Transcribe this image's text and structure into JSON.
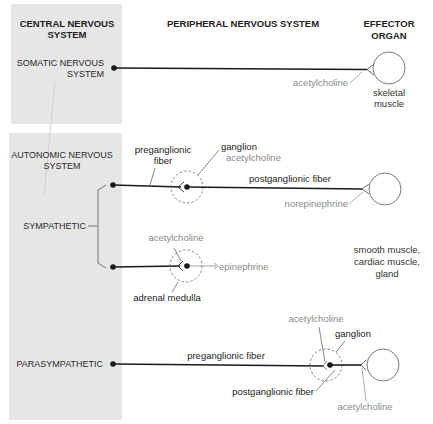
{
  "colors": {
    "panel": "#e6e6e6",
    "fiber": "#1a1a1a",
    "chemical_text": "#8a8a8a",
    "outline": "#6a6a6a"
  },
  "headers": {
    "cns_line1": "CENTRAL NERVOUS",
    "cns_line2": "SYSTEM",
    "pns": "PERIPHERAL NERVOUS SYSTEM",
    "effector_line1": "EFFECTOR",
    "effector_line2": "ORGAN"
  },
  "somatic": {
    "label_line1": "SOMATIC NERVOUS",
    "label_line2": "SYSTEM",
    "neurotransmitter": "acetylcholine",
    "effector_line1": "skeletal",
    "effector_line2": "muscle"
  },
  "autonomic": {
    "label_line1": "AUTONOMIC NERVOUS",
    "label_line2": "SYSTEM"
  },
  "sympathetic": {
    "label": "SYMPATHETIC",
    "preganglionic_line1": "preganglionic",
    "preganglionic_line2": "fiber",
    "ganglion": "ganglion",
    "ganglion_transmitter": "acetylcholine",
    "postganglionic": "postganglionic fiber",
    "effector_transmitter": "norepinephrine",
    "adrenal_transmitter": "acetylcholine",
    "adrenal_output": "epinephrine",
    "adrenal_label": "adrenal medulla",
    "effector_line1": "smooth muscle,",
    "effector_line2": "cardiac muscle,",
    "effector_line3": "gland"
  },
  "parasympathetic": {
    "label": "PARASYMPATHETIC",
    "preganglionic": "preganglionic fiber",
    "ganglion": "ganglion",
    "ganglion_transmitter": "acetylcholine",
    "postganglionic": "postganglionic fiber",
    "effector_transmitter": "acetylcholine"
  }
}
